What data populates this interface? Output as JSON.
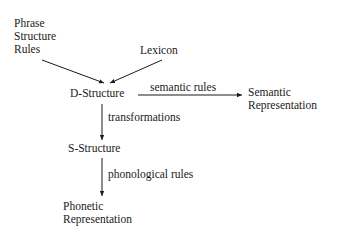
{
  "diagram": {
    "nodes": {
      "phrase_structure_rules": [
        "Phrase",
        "Structure",
        "Rules"
      ],
      "lexicon": "Lexicon",
      "d_structure": "D-Structure",
      "semantic_representation": [
        "Semantic",
        "Representation"
      ],
      "s_structure": "S-Structure",
      "phonetic_representation": [
        "Phonetic",
        "Representation"
      ]
    },
    "edges": {
      "semantic_rules": "semantic rules",
      "transformations": "transformations",
      "phonological_rules": "phonological rules"
    }
  }
}
